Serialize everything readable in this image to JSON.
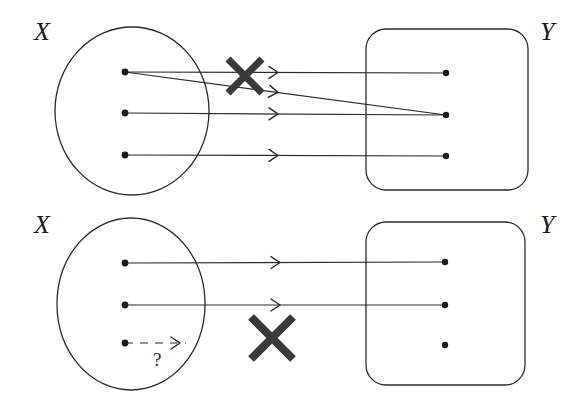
{
  "figure": {
    "stroke_color": "#2b2b2b",
    "mark_color": "#3a3a3a",
    "background_color": "#ffffff",
    "dot_color": "#1a1a1a"
  },
  "panels": [
    {
      "id": "top",
      "domain": {
        "label": "X",
        "shape": "ellipse",
        "cx": 132,
        "cy": 111,
        "rx": 77,
        "ry": 84,
        "label_x": 34,
        "label_y": 40,
        "elements": [
          {
            "id": "x1",
            "cx": 125,
            "cy": 72
          },
          {
            "id": "x2",
            "cx": 125,
            "cy": 113
          },
          {
            "id": "x3",
            "cx": 125,
            "cy": 155
          }
        ]
      },
      "codomain": {
        "label": "Y",
        "shape": "rounded-rect",
        "x": 366,
        "y": 29,
        "width": 162,
        "height": 161,
        "radius": 20,
        "label_x": 540,
        "label_y": 40,
        "elements": [
          {
            "id": "y1",
            "cx": 446,
            "cy": 73
          },
          {
            "id": "y2",
            "cx": 446,
            "cy": 115
          },
          {
            "id": "y3",
            "cx": 446,
            "cy": 156
          }
        ]
      },
      "mappings": [
        {
          "from": "x1",
          "to": "y1",
          "style": "solid",
          "x1": 125,
          "y1": 72,
          "x2": 446,
          "y2": 73,
          "arrow_x": 278
        },
        {
          "from": "x1",
          "to": "y2",
          "style": "solid",
          "x1": 125,
          "y1": 72,
          "x2": 446,
          "y2": 115,
          "arrow_x": 278
        },
        {
          "from": "x2",
          "to": "y3",
          "style": "solid",
          "x1": 125,
          "y1": 113,
          "x2": 446,
          "y2": 115,
          "arrow_x": 278
        },
        {
          "from": "x3",
          "to": "y3",
          "style": "solid",
          "x1": 125,
          "y1": 155,
          "x2": 446,
          "y2": 156,
          "arrow_x": 278
        }
      ],
      "cross_mark": {
        "cx": 245,
        "cy": 76,
        "size": 34,
        "thickness": 7
      },
      "reason": "one input maps to two outputs"
    },
    {
      "id": "bottom",
      "domain": {
        "label": "X",
        "shape": "ellipse",
        "cx": 131,
        "cy": 304,
        "rx": 74,
        "ry": 86,
        "label_x": 34,
        "label_y": 233,
        "elements": [
          {
            "id": "x1",
            "cx": 125,
            "cy": 263
          },
          {
            "id": "x2",
            "cx": 125,
            "cy": 305
          },
          {
            "id": "x3",
            "cx": 125,
            "cy": 343
          }
        ]
      },
      "codomain": {
        "label": "Y",
        "shape": "rounded-rect",
        "x": 366,
        "y": 222,
        "width": 159,
        "height": 163,
        "radius": 20,
        "label_x": 540,
        "label_y": 233,
        "elements": [
          {
            "id": "y1",
            "cx": 445,
            "cy": 262
          },
          {
            "id": "y2",
            "cx": 445,
            "cy": 305
          },
          {
            "id": "y3",
            "cx": 445,
            "cy": 345
          }
        ]
      },
      "mappings": [
        {
          "from": "x1",
          "to": "y1",
          "style": "solid",
          "x1": 125,
          "y1": 263,
          "x2": 445,
          "y2": 262,
          "arrow_x": 280
        },
        {
          "from": "x2",
          "to": "y2",
          "style": "solid",
          "x1": 125,
          "y1": 305,
          "x2": 445,
          "y2": 305,
          "arrow_x": 280
        },
        {
          "from": "x3",
          "to": "unknown",
          "style": "dashed",
          "x1": 125,
          "y1": 343,
          "x2": 186,
          "y2": 343,
          "arrow_x": 180
        }
      ],
      "unknown_marker": {
        "text": "?",
        "x": 153,
        "y": 366
      },
      "cross_mark": {
        "cx": 272,
        "cy": 338,
        "size": 42,
        "thickness": 8
      },
      "reason": "one input has no defined output"
    }
  ]
}
